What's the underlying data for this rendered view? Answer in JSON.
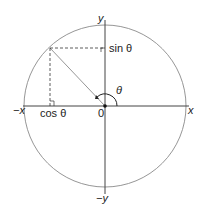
{
  "diagram": {
    "labels": {
      "y_pos": "y",
      "y_neg": "−y",
      "x_pos": "x",
      "x_neg": "−x",
      "origin": "0",
      "cos": "cos θ",
      "sin": "sin θ",
      "theta": "θ"
    },
    "colors": {
      "circle": "#8a8a8a",
      "axes": "#333333",
      "radius": "#8a8a8a",
      "dashed": "#333333",
      "text": "#222222"
    }
  }
}
